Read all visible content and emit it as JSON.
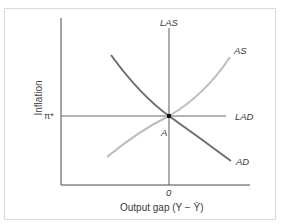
{
  "diagram": {
    "type": "economics-AD-AS-LAS-LAD",
    "y_axis_label": "Inflation",
    "x_axis_label": "Output gap (Y − Ȳ)",
    "x_tick": "0",
    "y_tick": "π*",
    "curves": {
      "las": "LAS",
      "as": "AS",
      "lad": "LAD",
      "ad": "AD"
    },
    "equilibrium_point": "A",
    "colors": {
      "axes": "#4a4a4a",
      "ad_curve": "#6e6e6e",
      "as_curve": "#bdbdbd",
      "las_lad_lines": "#6a6a6a",
      "point": "#111111",
      "frame_border": "#d9d9d9"
    }
  }
}
